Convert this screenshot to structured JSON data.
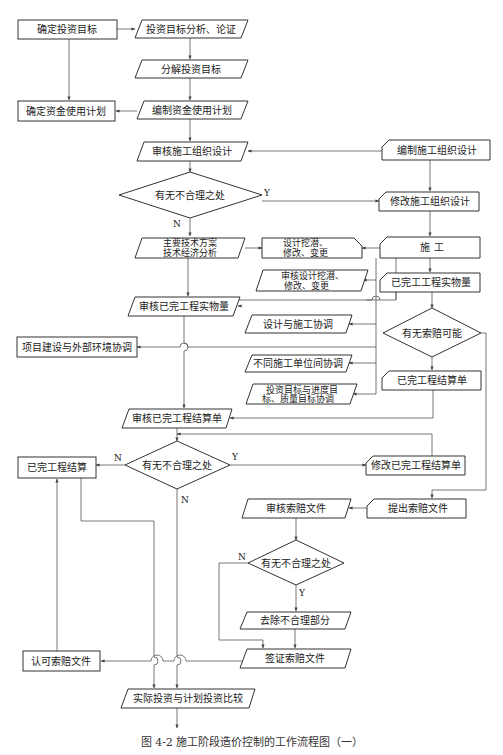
{
  "title": "图 4-2  施工阶段造价控制的工作流程图（一）",
  "colors": {
    "line": "#555555",
    "border": "#333333",
    "text": "#222222",
    "background": "#ffffff"
  },
  "nodes": {
    "n_confirm_goal": "确定投资目标",
    "n_goal_analysis": "投资目标分析、论证",
    "n_decompose_goal": "分解投资目标",
    "n_confirm_fund_plan": "确定资金使用计划",
    "n_compile_fund_plan": "编制资金使用计划",
    "n_review_org_design": "审核施工组织设计",
    "n_compile_org_design": "编制施工组织设计",
    "n_decision1": "有无不合理之处",
    "n_modify_org_design": "修改施工组织设计",
    "n_tech_plan_line1": "主要技术方案",
    "n_tech_plan_line2": "技术经济分析",
    "n_design_potential_line1": "设计挖潜、",
    "n_design_potential_line2": "修改、变更",
    "n_construction": "施  工",
    "n_review_design_potential_line1": "审核设计挖潜、",
    "n_review_design_potential_line2": "修改、变更",
    "n_completed_quantity": "已完工工程实物量",
    "n_review_completed_quantity": "审核已完工程实物量",
    "n_design_construction_coord": "设计与施工协调",
    "n_decision_claim": "有无索赔可能",
    "n_external_coord": "项目建设与外部环境协调",
    "n_units_coord": "不同施工单位间协调",
    "n_settlement_sheet": "已完工程结算单",
    "n_goal_coord_line1": "投资目标与进度目",
    "n_goal_coord_line2": "标、质量目标协调",
    "n_review_settlement_sheet": "审核已完工程结算单",
    "n_decision2": "有无不合理之处",
    "n_completed_settlement": "已完工程结算",
    "n_modify_settlement_sheet": "修改已完工程结算单",
    "n_submit_claim": "提出索赔文件",
    "n_review_claim": "审核索赔文件",
    "n_decision3": "有无不合理之处",
    "n_remove_unreasonable": "去除不合理部分",
    "n_approve_claim": "认可索赔文件",
    "n_visa_claim": "签证索赔文件",
    "n_compare_investment": "实际投资与计划投资比较"
  },
  "edge_labels": {
    "yes": "Y",
    "no": "N"
  }
}
